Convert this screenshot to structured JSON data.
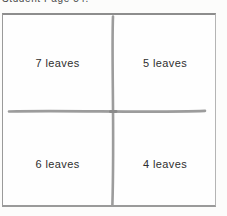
{
  "page": {
    "header_text": "Student Page 54."
  },
  "diagram": {
    "type": "four-quadrant-grid",
    "quadrants": [
      {
        "position": "top-left",
        "label": "7 leaves",
        "count": 7
      },
      {
        "position": "top-right",
        "label": "5 leaves",
        "count": 5
      },
      {
        "position": "bottom-left",
        "label": "6 leaves",
        "count": 6
      },
      {
        "position": "bottom-right",
        "label": "4 leaves",
        "count": 4
      }
    ],
    "colors": {
      "frame_border": "#8d8d8d",
      "divider_line": "#9c9c9c",
      "label_text": "#2e2e2e",
      "background": "#fefefe"
    }
  }
}
